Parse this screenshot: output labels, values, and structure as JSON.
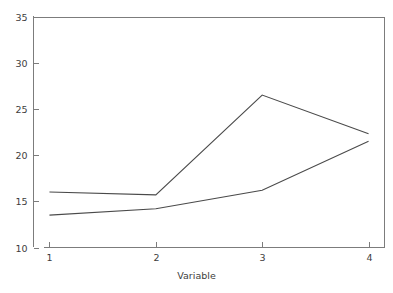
{
  "chart_data": {
    "type": "line",
    "title": "",
    "subtitle": "",
    "xlabel": "Variable",
    "ylabel": "",
    "x": [
      1,
      2,
      3,
      4
    ],
    "categories": [
      "1",
      "2",
      "3",
      "4"
    ],
    "xtick_labels": [
      "1",
      "2",
      "3",
      "4"
    ],
    "ytick_labels": [
      "10",
      "15",
      "20",
      "25",
      "30",
      "35"
    ],
    "yticks": [
      10,
      15,
      20,
      25,
      30,
      35
    ],
    "xlim": [
      0.85,
      4.15
    ],
    "ylim": [
      10,
      35
    ],
    "grid": false,
    "legend": false,
    "legend_position": "none",
    "annotations": [],
    "series": [
      {
        "name": "series-1",
        "color": "#4a4a4a",
        "values": [
          16.0,
          15.7,
          26.5,
          22.3
        ]
      },
      {
        "name": "series-2",
        "color": "#4a4a4a",
        "values": [
          13.5,
          14.2,
          16.2,
          21.5
        ]
      }
    ]
  },
  "axes": {
    "frame_color": "#7c7c7c",
    "background": "#ffffff",
    "text_color": "#3d3d3d"
  }
}
